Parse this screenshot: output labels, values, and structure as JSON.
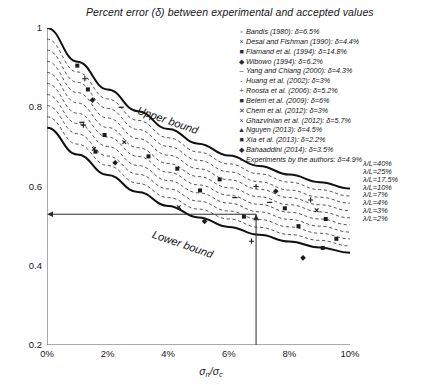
{
  "chart_data": {
    "type": "line",
    "title": "Percent error (δ) between experimental and accepted values",
    "xlabel": "σ_n/σ_c",
    "ylabel": "d_n/ji",
    "xlim": [
      0,
      10
    ],
    "ylim": [
      0.2,
      1
    ],
    "xticks": [
      "0%",
      "2%",
      "4%",
      "6%",
      "8%",
      "10%"
    ],
    "xtick_values": [
      0,
      2,
      4,
      6,
      8,
      10
    ],
    "yticks": [
      "1",
      "0.8",
      "0.6",
      "0.4",
      "0.2"
    ],
    "ytick_values": [
      1,
      0.8,
      0.6,
      0.4,
      0.2
    ],
    "grid": false,
    "legend_position": "top-right",
    "series": [
      {
        "name": "Upper bound",
        "style": "solid-thick",
        "x": [
          0,
          1,
          2,
          3,
          4,
          5,
          6,
          7,
          8,
          9,
          10
        ],
        "y": [
          1.0,
          0.915,
          0.845,
          0.79,
          0.745,
          0.708,
          0.678,
          0.652,
          0.63,
          0.611,
          0.595
        ]
      },
      {
        "name": "λ/L=40%",
        "style": "dashed",
        "x": [
          0,
          1,
          2,
          3,
          4,
          5,
          6,
          7,
          8,
          9,
          10
        ],
        "y": [
          0.972,
          0.889,
          0.821,
          0.767,
          0.723,
          0.687,
          0.657,
          0.632,
          0.611,
          0.592,
          0.576
        ]
      },
      {
        "name": "λ/L=25%",
        "style": "dashed",
        "x": [
          0,
          1,
          2,
          3,
          4,
          5,
          6,
          7,
          8,
          9,
          10
        ],
        "y": [
          0.944,
          0.863,
          0.797,
          0.744,
          0.701,
          0.666,
          0.637,
          0.612,
          0.591,
          0.573,
          0.558
        ]
      },
      {
        "name": "λ/L=17.5%",
        "style": "dashed",
        "x": [
          0,
          1,
          2,
          3,
          4,
          5,
          6,
          7,
          8,
          9,
          10
        ],
        "y": [
          0.916,
          0.837,
          0.773,
          0.721,
          0.679,
          0.645,
          0.617,
          0.593,
          0.572,
          0.554,
          0.539
        ]
      },
      {
        "name": "λ/L=10%",
        "style": "dashed",
        "x": [
          0,
          1,
          2,
          3,
          4,
          5,
          6,
          7,
          8,
          9,
          10
        ],
        "y": [
          0.888,
          0.811,
          0.749,
          0.698,
          0.658,
          0.625,
          0.597,
          0.574,
          0.554,
          0.536,
          0.521
        ]
      },
      {
        "name": "λ/L=7%",
        "style": "dashed",
        "x": [
          0,
          1,
          2,
          3,
          4,
          5,
          6,
          7,
          8,
          9,
          10
        ],
        "y": [
          0.86,
          0.785,
          0.725,
          0.676,
          0.636,
          0.604,
          0.578,
          0.555,
          0.535,
          0.518,
          0.503
        ]
      },
      {
        "name": "λ/L=4%",
        "style": "dashed",
        "x": [
          0,
          1,
          2,
          3,
          4,
          5,
          6,
          7,
          8,
          9,
          10
        ],
        "y": [
          0.832,
          0.759,
          0.701,
          0.653,
          0.615,
          0.584,
          0.558,
          0.536,
          0.517,
          0.5,
          0.485
        ]
      },
      {
        "name": "λ/L=3%",
        "style": "dashed",
        "x": [
          0,
          1,
          2,
          3,
          4,
          5,
          6,
          7,
          8,
          9,
          10
        ],
        "y": [
          0.804,
          0.733,
          0.677,
          0.631,
          0.594,
          0.563,
          0.538,
          0.517,
          0.498,
          0.482,
          0.468
        ]
      },
      {
        "name": "λ/L=2%",
        "style": "dashed",
        "x": [
          0,
          1,
          2,
          3,
          4,
          5,
          6,
          7,
          8,
          9,
          10
        ],
        "y": [
          0.776,
          0.707,
          0.653,
          0.608,
          0.572,
          0.543,
          0.518,
          0.497,
          0.479,
          0.464,
          0.45
        ]
      },
      {
        "name": "Lower bound",
        "style": "solid-thick",
        "x": [
          0,
          1,
          2,
          3,
          4,
          5,
          6,
          7,
          8,
          9,
          10
        ],
        "y": [
          0.748,
          0.681,
          0.629,
          0.586,
          0.551,
          0.522,
          0.498,
          0.478,
          0.461,
          0.446,
          0.433
        ]
      }
    ],
    "scatter_points": [
      {
        "x": 1.0,
        "y": 0.905
      },
      {
        "x": 1.25,
        "y": 0.872
      },
      {
        "x": 1.35,
        "y": 0.845
      },
      {
        "x": 1.5,
        "y": 0.818
      },
      {
        "x": 2.45,
        "y": 0.8
      },
      {
        "x": 1.15,
        "y": 0.762
      },
      {
        "x": 1.2,
        "y": 0.755
      },
      {
        "x": 1.9,
        "y": 0.73
      },
      {
        "x": 2.55,
        "y": 0.712
      },
      {
        "x": 1.55,
        "y": 0.695
      },
      {
        "x": 1.6,
        "y": 0.688
      },
      {
        "x": 3.35,
        "y": 0.676
      },
      {
        "x": 2.25,
        "y": 0.66
      },
      {
        "x": 4.3,
        "y": 0.645
      },
      {
        "x": 5.7,
        "y": 0.618
      },
      {
        "x": 6.9,
        "y": 0.6
      },
      {
        "x": 5.05,
        "y": 0.59
      },
      {
        "x": 7.55,
        "y": 0.588
      },
      {
        "x": 6.2,
        "y": 0.572
      },
      {
        "x": 7.35,
        "y": 0.56
      },
      {
        "x": 8.7,
        "y": 0.566
      },
      {
        "x": 7.85,
        "y": 0.545
      },
      {
        "x": 8.9,
        "y": 0.54
      },
      {
        "x": 4.35,
        "y": 0.548
      },
      {
        "x": 6.5,
        "y": 0.524
      },
      {
        "x": 9.2,
        "y": 0.518
      },
      {
        "x": 5.2,
        "y": 0.512
      },
      {
        "x": 8.3,
        "y": 0.5
      },
      {
        "x": 9.55,
        "y": 0.468
      },
      {
        "x": 6.75,
        "y": 0.462
      },
      {
        "x": 9.1,
        "y": 0.445
      },
      {
        "x": 8.45,
        "y": 0.42
      }
    ],
    "annotations": {
      "upper_bound": "Upper bound",
      "lower_bound": "Lower bound",
      "reader_line_x_percent": 6.9,
      "reader_line_y_value": 0.53
    }
  },
  "legend": {
    "entries": [
      {
        "marker": "▫",
        "label": "Bandis (1980): δ=6.5%"
      },
      {
        "marker": "×",
        "label": "Desai and Fishman (1990): δ=4.4%"
      },
      {
        "marker": "■",
        "label": "Flamand et al. (1994): δ=14.8%"
      },
      {
        "marker": "◆",
        "label": "Wibowo (1994): δ=6.2%"
      },
      {
        "marker": "–",
        "label": "Yang and Chiang (2000): δ=4.3%"
      },
      {
        "marker": "-",
        "label": "Huang et al. (2002): δ=3%"
      },
      {
        "marker": "+",
        "label": "Roosta et al. (2006): δ=5.2%"
      },
      {
        "marker": "■",
        "label": "Belem et al. (2009): δ=6%"
      },
      {
        "marker": "✕",
        "label": "Chem et al. (2012): δ=3%"
      },
      {
        "marker": "×",
        "label": "Ghazvinian et al. (2012): δ=5.7%"
      },
      {
        "marker": "▲",
        "label": "Nguyen (2013): δ=4.5%"
      },
      {
        "marker": "■",
        "label": "Xia et al. (2013): δ=2.2%"
      },
      {
        "marker": "◆",
        "label": "Bahaaddini (2014): δ=3.5%"
      },
      {
        "marker": "▪",
        "label": "Experiments by the authors: δ=4.9%"
      }
    ]
  },
  "lambda_labels": [
    {
      "text": "λ/L=40%",
      "y_value": 0.657
    },
    {
      "text": "λ/L=25%",
      "y_value": 0.637
    },
    {
      "text": "λ/L=17.5%",
      "y_value": 0.617
    },
    {
      "text": "λ/L=10%",
      "y_value": 0.597
    },
    {
      "text": "λ/L=7%",
      "y_value": 0.578
    },
    {
      "text": "λ/L=4%",
      "y_value": 0.558
    },
    {
      "text": "λ/L=3%",
      "y_value": 0.538
    },
    {
      "text": "λ/L=2%",
      "y_value": 0.518
    }
  ],
  "axes": {
    "y_label_main": "d",
    "y_label_sub": "n",
    "y_label_rest": "/ji",
    "x_label_main": "σ",
    "x_label_sub1": "n",
    "x_label_mid": "/σ",
    "x_label_sub2": "c"
  }
}
